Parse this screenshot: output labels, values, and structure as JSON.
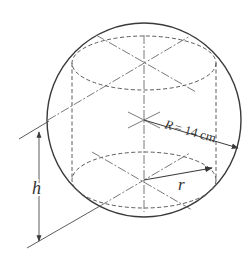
{
  "figure": {
    "labels": {
      "sphere_radius": "R = 14 cm",
      "sphere_radius_symbol": "R",
      "sphere_radius_value": "= 14 cm",
      "cylinder_radius": "r",
      "cylinder_height": "h"
    },
    "colors": {
      "stroke": "#3a3a3a",
      "dashed": "#5a5a5a",
      "background": "#ffffff"
    },
    "geometry": {
      "sphere": {
        "cx": 144,
        "cy": 120,
        "r": 97
      },
      "cylinder": {
        "left_x": 72,
        "right_x": 215,
        "top_cy": 63,
        "bottom_cy": 180,
        "rx": 72,
        "ry": 28
      },
      "sphere_radius_value_cm": 14
    }
  }
}
